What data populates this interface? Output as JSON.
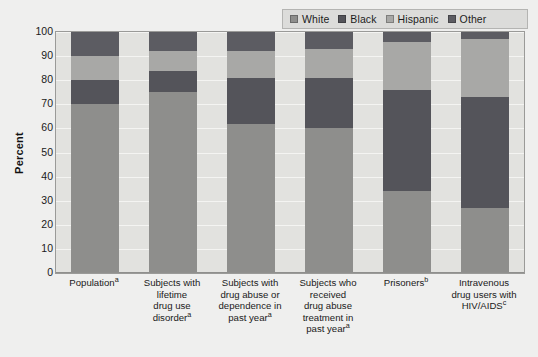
{
  "legend": {
    "position": "top-right",
    "entries": [
      {
        "label": "White",
        "color": "#8e8e8c"
      },
      {
        "label": "Black",
        "color": "#54545a"
      },
      {
        "label": "Hispanic",
        "color": "#a8a8a6"
      },
      {
        "label": "Other",
        "color": "#5c5c62"
      }
    ]
  },
  "axis": {
    "y_title": "Percent",
    "y_ticks": [
      "0",
      "10",
      "20",
      "30",
      "40",
      "50",
      "60",
      "70",
      "80",
      "90",
      "100"
    ]
  },
  "categories_display": [
    {
      "lines": [
        "Population"
      ],
      "sup": "a"
    },
    {
      "lines": [
        "Subjects with",
        "lifetime",
        "drug use",
        "disorder"
      ],
      "sup": "a"
    },
    {
      "lines": [
        "Subjects with",
        "drug abuse or",
        "dependence in",
        "past year"
      ],
      "sup": "a"
    },
    {
      "lines": [
        "Subjects who",
        "received",
        "drug abuse",
        "treatment in",
        "past year"
      ],
      "sup": "a"
    },
    {
      "lines": [
        "Prisoners"
      ],
      "sup": "b"
    },
    {
      "lines": [
        "Intravenous",
        "drug users with",
        "HIV/AIDS"
      ],
      "sup": "c"
    }
  ],
  "chart_data": {
    "type": "bar",
    "subtype": "stacked-100-percent",
    "title": "",
    "xlabel": "",
    "ylabel": "Percent",
    "ylim": [
      0,
      100
    ],
    "ytick_step": 10,
    "grid": true,
    "legend_position": "top-right",
    "categories": [
      "Populationᵃ",
      "Subjects with lifetime drug use disorderᵃ",
      "Subjects with drug abuse or dependence in past yearᵃ",
      "Subjects who received drug abuse treatment in past yearᵃ",
      "Prisonersᵇ",
      "Intravenous drug users with HIV/AIDSᶜ"
    ],
    "series": [
      {
        "name": "White",
        "color": "#8e8e8c",
        "values": [
          70,
          75,
          62,
          60,
          34,
          27
        ]
      },
      {
        "name": "Black",
        "color": "#54545a",
        "values": [
          10,
          9,
          19,
          21,
          42,
          46
        ]
      },
      {
        "name": "Hispanic",
        "color": "#a8a8a6",
        "values": [
          10,
          8,
          11,
          12,
          20,
          24
        ]
      },
      {
        "name": "Other",
        "color": "#5c5c62",
        "values": [
          10,
          8,
          8,
          7,
          4,
          3
        ]
      }
    ]
  }
}
